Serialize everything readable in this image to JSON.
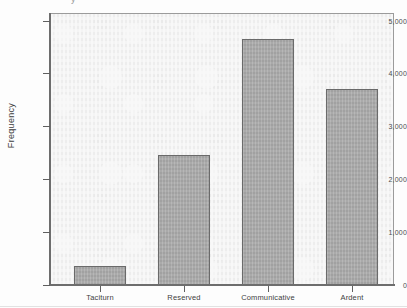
{
  "chart_data": {
    "type": "bar",
    "title": "",
    "xlabel": "",
    "ylabel": "Frequency",
    "categories": [
      "Taciturn",
      "Reserved",
      "Communicative",
      "Ardent"
    ],
    "values": [
      360,
      2460,
      4660,
      3710
    ],
    "ylim": [
      0,
      5000
    ],
    "yticks": [
      0,
      1000,
      2000,
      3000,
      4000,
      5000
    ],
    "ytick_labels": [
      "0",
      "1,000",
      "2,000",
      "3,000",
      "4,000",
      "5,000"
    ],
    "grid": false,
    "legend": null,
    "series": [
      {
        "name": "Frequency",
        "values": [
          360,
          2460,
          4660,
          3710
        ]
      }
    ]
  },
  "style": {
    "bar_fill": "#a9a9a9",
    "bar_border": "#6a6a6a",
    "plot_background": "#f1f1f1",
    "axis_color": "#6d6d6d",
    "text_color": "#3d3d3d"
  },
  "artifacts": {
    "clipped_title_fragment": "y"
  }
}
